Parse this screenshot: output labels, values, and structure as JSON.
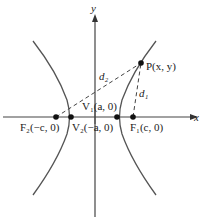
{
  "diagram": {
    "type": "hyperbola",
    "axes": {
      "x_label": "x",
      "y_label": "y"
    },
    "point_P": {
      "label": "P(x, y)"
    },
    "vertices": [
      {
        "label": "V₁(a, 0)"
      },
      {
        "label": "V₂(−a, 0)"
      }
    ],
    "foci": [
      {
        "label": "F₁(c, 0)"
      },
      {
        "label": "F₂(−c, 0)"
      }
    ],
    "distances": [
      {
        "label": "d₁"
      },
      {
        "label": "d₂"
      }
    ],
    "colors": {
      "stroke": "#444444",
      "text": "#222222"
    }
  }
}
